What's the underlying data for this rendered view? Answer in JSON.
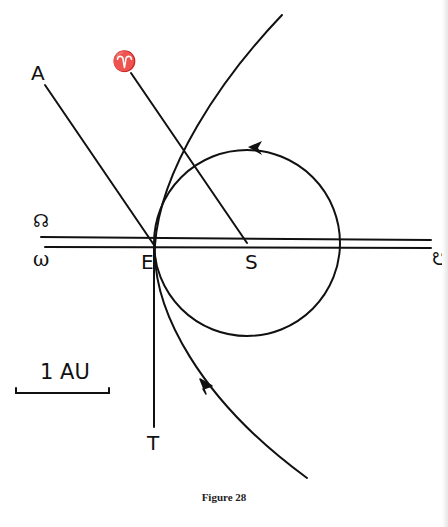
{
  "figure": {
    "caption": "Figure 28",
    "colors": {
      "ink": "#111111",
      "background": "#ffffff"
    }
  },
  "labels": {
    "A": "A",
    "aries": "♈",
    "ascending_node_sym": "☊",
    "omega": "ω",
    "E": "E",
    "S": "S",
    "descending_node_sym": "☋",
    "T": "T",
    "scale": "1 AU"
  },
  "geometry": {
    "sun_S": [
      247,
      243
    ],
    "earth_E": [
      154,
      245
    ],
    "earth_orbit_radius_px": 93,
    "au_scale_px": 94
  }
}
